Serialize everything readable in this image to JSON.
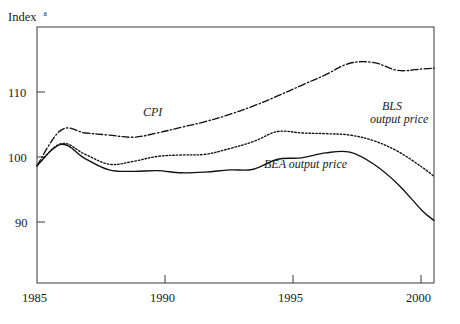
{
  "figure": {
    "axis_title": "Index",
    "axis_title_superscript": "a",
    "background_color": "#ffffff",
    "line_color": "#111111",
    "frame_color": "#4a4a4a"
  },
  "chart_data": {
    "type": "line",
    "title": "",
    "xlabel": "",
    "ylabel": "Index",
    "xlim": [
      1985,
      2001.5
    ],
    "ylim": [
      83.5,
      119.5
    ],
    "xticks": [
      1985,
      1990,
      1995,
      2000
    ],
    "xtick_labels": [
      "1985",
      "1990",
      "1995",
      "2000"
    ],
    "yticks": [
      90,
      100,
      110
    ],
    "ytick_labels": [
      "90",
      "100",
      "110"
    ],
    "grid": false,
    "legend": "inline-annotations",
    "x": [
      1985,
      1986,
      1987,
      1988,
      1989,
      1990,
      1991,
      1992,
      1993,
      1994,
      1995,
      1996,
      1997,
      1998,
      1999,
      2000,
      2001,
      2001.5
    ],
    "series": [
      {
        "name": "CPI",
        "style": "dash-dot",
        "label": "CPI",
        "label_x": 1989.2,
        "label_y": 107.6,
        "values": [
          100.0,
          105.0,
          104.6,
          104.3,
          104.0,
          104.6,
          105.4,
          106.2,
          107.2,
          108.4,
          109.8,
          111.3,
          112.8,
          114.4,
          114.5,
          113.4,
          113.6,
          113.7
        ]
      },
      {
        "name": "BLS output price",
        "style": "dotted",
        "label_line1": "BLS",
        "label_line2": "output price",
        "label_x": 1999.0,
        "label_y": 107.2,
        "values": [
          100.0,
          103.1,
          101.6,
          100.2,
          100.6,
          101.3,
          101.5,
          101.6,
          102.4,
          103.4,
          104.8,
          104.6,
          104.5,
          104.3,
          103.5,
          102.0,
          99.8,
          98.5
        ]
      },
      {
        "name": "BEA output price",
        "style": "solid",
        "label": "BEA output price",
        "label_x": 1995.0,
        "label_y": 99.0,
        "values": [
          100.0,
          103.0,
          101.0,
          99.4,
          99.2,
          99.3,
          99.0,
          99.1,
          99.4,
          99.5,
          100.9,
          101.1,
          101.8,
          101.9,
          100.2,
          97.4,
          93.7,
          92.3
        ]
      }
    ]
  }
}
